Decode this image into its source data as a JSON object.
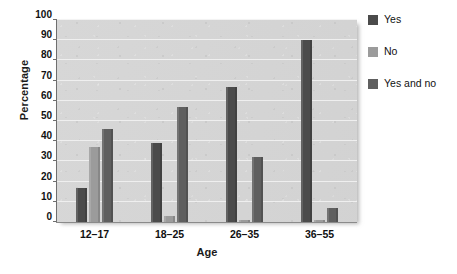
{
  "chart_data": {
    "type": "bar",
    "title": "",
    "xlabel": "Age",
    "ylabel": "Percentage",
    "ylim": [
      0,
      100
    ],
    "ytick_step": 10,
    "yticks": [
      0,
      10,
      20,
      30,
      40,
      50,
      60,
      70,
      80,
      90,
      100
    ],
    "grid": true,
    "legend_position": "right",
    "categories": [
      "12–17",
      "18–25",
      "26–35",
      "36–55"
    ],
    "series": [
      {
        "name": "Yes",
        "color": "#4b4b4b",
        "values": [
          17,
          39,
          67,
          90
        ]
      },
      {
        "name": "No",
        "color": "#9b9b9b",
        "values": [
          37,
          3,
          1,
          1
        ]
      },
      {
        "name": "Yes and no",
        "color": "#5f5f5f",
        "values": [
          46,
          57,
          32,
          7
        ]
      }
    ]
  },
  "legend": {
    "items": [
      {
        "label": "Yes"
      },
      {
        "label": "No"
      },
      {
        "label": "Yes and no"
      }
    ]
  },
  "colors": {
    "series_yes": "#4b4b4b",
    "series_no": "#9b9b9b",
    "series_yes_and_no": "#5f5f5f",
    "plot_background": "#d4d4d4",
    "gridline": "#f2f2f2",
    "axis": "#6f6f6f",
    "page_background": "#ffffff",
    "text": "#111111"
  }
}
